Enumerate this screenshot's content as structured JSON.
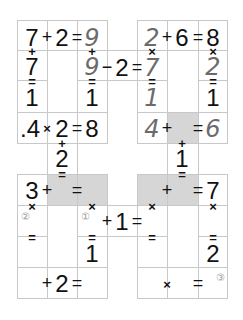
{
  "puzzle": {
    "colors": {
      "grid_line": "#c8c8c8",
      "shaded_cell": "#d6d6d6",
      "printed": "#111111",
      "handwritten": "#6b6b6b",
      "marker": "#9a9a9a"
    },
    "top_left": {
      "row1": {
        "a": "7",
        "op": "+",
        "b": "2",
        "eq": "=",
        "c": "9"
      },
      "col1": {
        "op": "+",
        "b": "7",
        "eq": "=",
        "c": "1"
      },
      "col3": {
        "op": "+",
        "b": "9",
        "eq": "=",
        "c": "1"
      }
    },
    "top_mid": {
      "op": "−",
      "b": "2",
      "eq": "=",
      "c": "7"
    },
    "top_right": {
      "row1": {
        "a": "2",
        "op": "+",
        "b": "6",
        "eq": "=",
        "c": "8"
      },
      "col1": {
        "op": "×",
        "eq": "=",
        "c": "1"
      },
      "col3": {
        "op": "×",
        "b": "2",
        "eq": "=",
        "c": "1"
      }
    },
    "left_row3": {
      "a": ".4",
      "op": "×",
      "b": "2",
      "eq": "=",
      "c": "8"
    },
    "left_link": {
      "op": "+",
      "b": "2",
      "eq": "="
    },
    "right_row3": {
      "a": "4",
      "op": "+",
      "eq": "=",
      "c": "6"
    },
    "right_link": {
      "op": "+",
      "b": "1",
      "eq": "="
    },
    "bottom_left": {
      "row1": {
        "a": "3",
        "op": "+",
        "eq": "="
      },
      "col1_op": "×",
      "col3_op": "×",
      "marker2": "②",
      "marker1": "①",
      "col1_eq": "=",
      "col3_eq": "=",
      "col3_c": "1",
      "row3": {
        "op": "+",
        "b": "2",
        "eq": "="
      }
    },
    "bottom_mid": {
      "op": "+",
      "b": "1",
      "eq": "="
    },
    "bottom_right": {
      "row1": {
        "op": "+",
        "eq": "=",
        "c": "7"
      },
      "col1_op": "×",
      "col3_op": "×",
      "col1_eq": "=",
      "col3_eq": "=",
      "col3_c": "2",
      "row3": {
        "op": "×",
        "eq": "="
      },
      "marker3": "③"
    }
  }
}
